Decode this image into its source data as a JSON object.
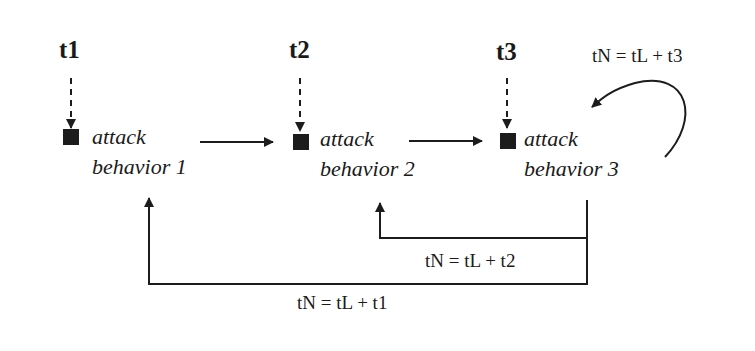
{
  "diagram": {
    "triggers": [
      {
        "label": "t1"
      },
      {
        "label": "t2"
      },
      {
        "label": "t3"
      }
    ],
    "behaviors": [
      {
        "line1": "attack",
        "line2": "behavior 1"
      },
      {
        "line1": "attack",
        "line2": "behavior 2"
      },
      {
        "line1": "attack",
        "line2": "behavior 3"
      }
    ],
    "feedback": {
      "self_loop": "tN = tL + t3",
      "to_behavior_2": "tN = tL + t2",
      "to_behavior_1": "tN = tL + t1"
    },
    "colors": {
      "ink": "#1c1c1c",
      "background": "#ffffff"
    }
  }
}
